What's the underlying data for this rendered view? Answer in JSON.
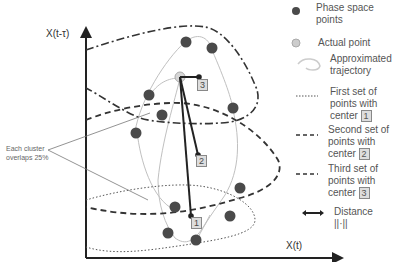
{
  "axes": {
    "y_label": "X(t-τ)",
    "x_label": "X(t)"
  },
  "annotation": {
    "overlap_note": "Each cluster overlaps 25%"
  },
  "centers": [
    {
      "id": "1",
      "label": "1"
    },
    {
      "id": "2",
      "label": "2"
    },
    {
      "id": "3",
      "label": "3"
    }
  ],
  "legend": {
    "items": [
      {
        "icon": "dark-dot-icon",
        "label": "Phase space points"
      },
      {
        "icon": "light-dot-icon",
        "label": "Actual point"
      },
      {
        "icon": "trajectory-curve-icon",
        "label": "Approximated trajectory"
      },
      {
        "icon": "dotted-line-icon",
        "label": "First set of points with center",
        "center": "1"
      },
      {
        "icon": "dashed-line-icon",
        "label": "Second set of points with center",
        "center": "2"
      },
      {
        "icon": "dash-dot-line-icon",
        "label": "Third set of points with center",
        "center": "3"
      },
      {
        "icon": "double-arrow-icon",
        "label": "Distance",
        "sub": "||·||"
      }
    ]
  },
  "colors": {
    "point": "#4a4a4a",
    "actual_point": "#c8c8c8",
    "trajectory": "#bbbbbb",
    "cluster": "#333333"
  }
}
